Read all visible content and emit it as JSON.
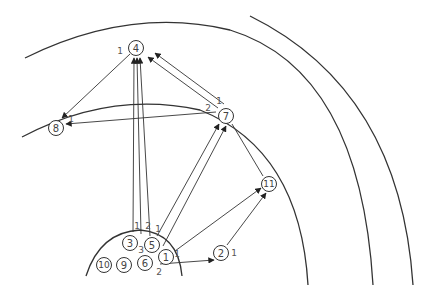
{
  "diagram": {
    "type": "concentric-arc network",
    "nodes": [
      {
        "id": "1",
        "label": "1"
      },
      {
        "id": "2",
        "label": "2"
      },
      {
        "id": "3",
        "label": "3"
      },
      {
        "id": "4",
        "label": "4"
      },
      {
        "id": "5",
        "label": "5"
      },
      {
        "id": "6",
        "label": "6"
      },
      {
        "id": "7",
        "label": "7"
      },
      {
        "id": "8",
        "label": "8"
      },
      {
        "id": "9",
        "label": "9"
      },
      {
        "id": "10",
        "label": "10"
      },
      {
        "id": "11",
        "label": "11"
      }
    ],
    "edges": [
      {
        "from": "4",
        "to": "8",
        "label": "1",
        "arrow": "end"
      },
      {
        "from": "7",
        "to": "8",
        "label": "1",
        "arrow": "end"
      },
      {
        "from": "3",
        "to": "4",
        "label": "1",
        "arrow": "end"
      },
      {
        "from": "5",
        "to": "4",
        "label": "2",
        "arrow": "end"
      },
      {
        "from": "5",
        "to": "4",
        "label": "1",
        "arrow": "end"
      },
      {
        "from": "7",
        "to": "4",
        "label": "2",
        "arrow": "end"
      },
      {
        "from": "7",
        "to": "4",
        "label": "1",
        "arrow": "end"
      },
      {
        "from": "5",
        "to": "7",
        "label": "",
        "arrow": "end"
      },
      {
        "from": "1",
        "to": "7",
        "label": "",
        "arrow": "end"
      },
      {
        "from": "1",
        "to": "11",
        "label": "1",
        "arrow": "end"
      },
      {
        "from": "2",
        "to": "11",
        "label": "1",
        "arrow": "end"
      },
      {
        "from": "6",
        "to": "2",
        "label": "2",
        "arrow": "end"
      },
      {
        "from": "11",
        "to": "4",
        "label": "",
        "arrow": "none"
      }
    ],
    "node_edge_labels": {
      "between_3_5": "3"
    }
  }
}
